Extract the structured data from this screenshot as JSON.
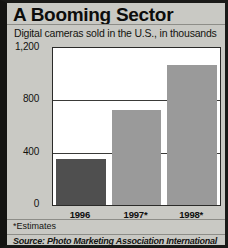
{
  "chart_data": {
    "type": "bar",
    "title": "A Booming Sector",
    "subtitle": "Digital cameras sold in the U.S., in thousands",
    "categories": [
      "1996",
      "1997*",
      "1998*"
    ],
    "values": [
      350,
      730,
      1070
    ],
    "series": [
      {
        "name": "Digital cameras sold",
        "values": [
          350,
          730,
          1070
        ]
      }
    ],
    "xlabel": "",
    "ylabel": "",
    "ylim": [
      0,
      1200
    ],
    "yticks": [
      0,
      400,
      800,
      1200
    ],
    "ytick_labels": [
      "0",
      "400",
      "800",
      "1,200"
    ],
    "grid": true,
    "legend": "none",
    "bar_colors": [
      "#4f4f4f",
      "#9a9a9a",
      "#9a9a9a"
    ],
    "plot_background": "#ffffff",
    "figure_background": "#c9c9c4",
    "footnote": "*Estimates",
    "source": "Source: Photo Marketing Association International"
  }
}
